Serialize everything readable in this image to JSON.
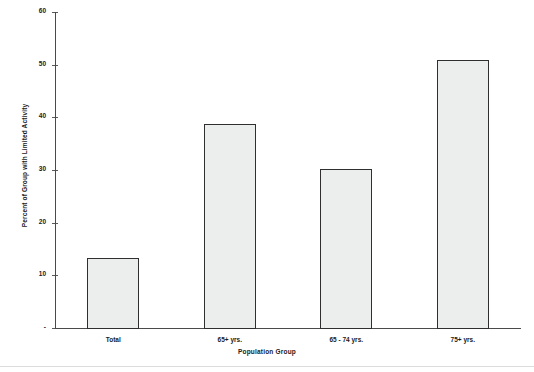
{
  "chart_data": {
    "type": "bar",
    "title": "",
    "xlabel": "Population Group",
    "ylabel": "Percent of Group with Limited Activity",
    "categories": [
      "Total",
      "65+ yrs.",
      "65 - 74 yrs.",
      "75+ yrs."
    ],
    "values": [
      13.5,
      39.0,
      30.3,
      51.0
    ],
    "ylim": [
      0,
      60
    ],
    "yticks": [
      0,
      10,
      20,
      30,
      40,
      50,
      60
    ],
    "ytick_labels": [
      "-",
      "10",
      "20",
      "30",
      "40",
      "50",
      "60"
    ],
    "grid": false,
    "legend": false,
    "legend_position": "none",
    "bar_fill": "#eceded",
    "bar_border": "#2f2f2f",
    "axis_color": "#4a4a4a"
  },
  "axes": {
    "y_title": "Percent of Group with Limited Activity",
    "x_title": "Population Group"
  }
}
